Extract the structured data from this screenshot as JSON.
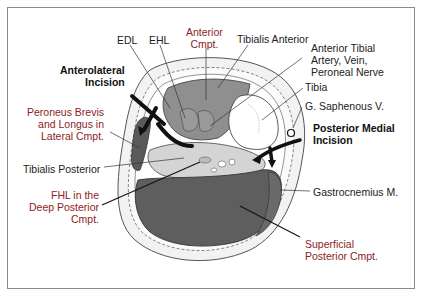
{
  "diagram": {
    "colors": {
      "compartment_label": "#8b2323",
      "structure_label": "#222222",
      "incision_label": "#111111",
      "muscle_dark": "#5a5a5a",
      "muscle_mid": "#8f8f8f",
      "muscle_light": "#d4d4d4",
      "frame": "#8a8a8a"
    },
    "labels": {
      "edl": "EDL",
      "ehl": "EHL",
      "anterior_cmpt": "Anterior\nCmpt.",
      "tibialis_anterior": "Tibialis Anterior",
      "anterior_tibial": "Anterior Tibial\nArtery, Vein,\nPeroneal Nerve",
      "anterolateral_incision": "Anterolateral\nIncision",
      "tibia": "Tibia",
      "g_saphenous": "G. Saphenous V.",
      "peroneus": "Peroneus Brevis\nand Longus in\nLateral Cmpt.",
      "posterior_medial_incision": "Posterior Medial\nIncision",
      "tibialis_posterior": "Tibialis Posterior",
      "fhl": "FHL in the\nDeep Posterior\nCmpt.",
      "gastrocnemius": "Gastrocnemius M.",
      "superficial_posterior": "Superficial\nPosterior Cmpt."
    }
  }
}
